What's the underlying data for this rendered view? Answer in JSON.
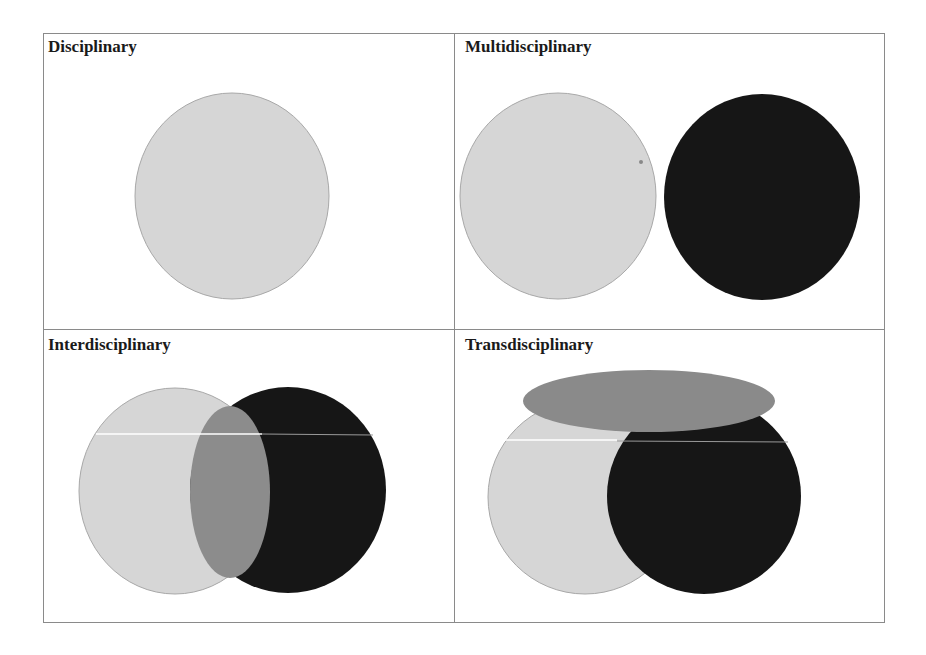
{
  "panels": [
    {
      "id": "disciplinary",
      "label": "Disciplinary",
      "position": "top-left"
    },
    {
      "id": "multidisciplinary",
      "label": "Multidisciplinary",
      "position": "top-right"
    },
    {
      "id": "interdisciplinary",
      "label": "Interdisciplinary",
      "position": "bottom-left"
    },
    {
      "id": "transdisciplinary",
      "label": "Transdisciplinary",
      "position": "bottom-right"
    }
  ],
  "colors": {
    "light_circle": "#d6d6d6",
    "dark_circle": "#161616",
    "overlap_grey": "#8c8c8c",
    "border": "#8a8a8a",
    "circle_outline": "#a8a8a8"
  }
}
